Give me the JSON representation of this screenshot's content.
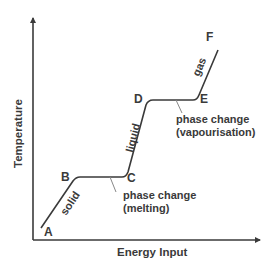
{
  "diagram": {
    "axes": {
      "x_label": "Energy Input",
      "y_label": "Temperature"
    },
    "points": [
      {
        "id": "A",
        "label": "A"
      },
      {
        "id": "B",
        "label": "B"
      },
      {
        "id": "C",
        "label": "C"
      },
      {
        "id": "D",
        "label": "D"
      },
      {
        "id": "E",
        "label": "E"
      },
      {
        "id": "F",
        "label": "F"
      }
    ],
    "segments": {
      "solid": "solid",
      "liquid": "liquid",
      "gas": "gas"
    },
    "annotations": {
      "melting_line1": "phase change",
      "melting_line2": "(melting)",
      "vapour_line1": "phase change",
      "vapour_line2": "(vapourisation)"
    },
    "colors": {
      "line": "#3a3a3a",
      "text": "#3a3a3a",
      "leader": "#888888"
    }
  }
}
